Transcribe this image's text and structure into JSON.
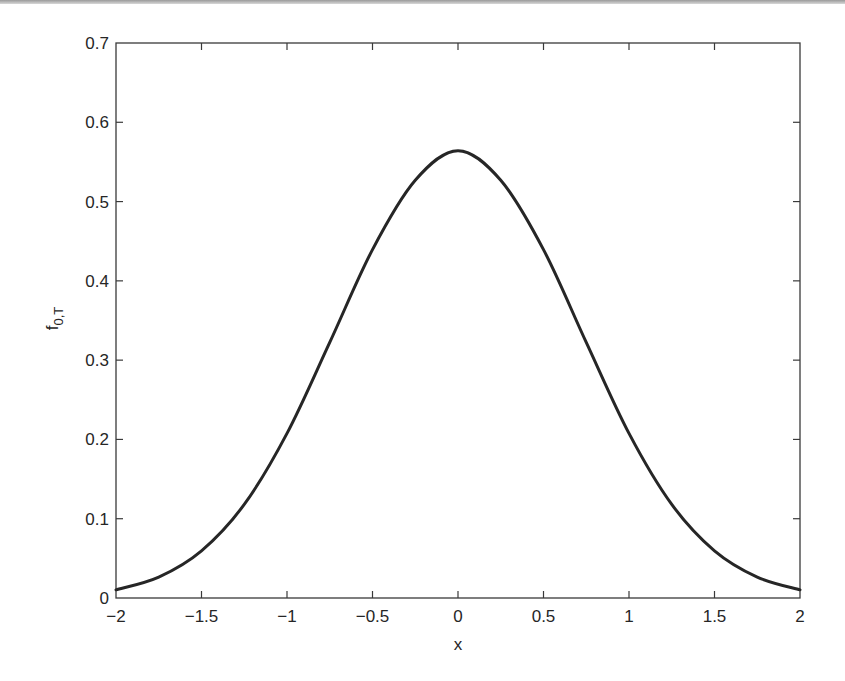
{
  "chart_data": {
    "type": "line",
    "title": "",
    "xlabel": "x",
    "ylabel": "f",
    "ylabel_subscript": "0,T",
    "xlim": [
      -2,
      2
    ],
    "ylim": [
      0,
      0.7
    ],
    "grid": false,
    "legend": null,
    "xticks": [
      -2,
      -1.5,
      -1,
      -0.5,
      0,
      0.5,
      1,
      1.5,
      2
    ],
    "xtick_labels": [
      "−2",
      "−1.5",
      "−1",
      "−0.5",
      "0",
      "0.5",
      "1",
      "1.5",
      "2"
    ],
    "yticks": [
      0,
      0.1,
      0.2,
      0.3,
      0.4,
      0.5,
      0.6,
      0.7
    ],
    "ytick_labels": [
      "0",
      "0.1",
      "0.2",
      "0.3",
      "0.4",
      "0.5",
      "0.6",
      "0.7"
    ],
    "series": [
      {
        "name": "f_0,T",
        "color": "#262626",
        "x": [
          -2.0,
          -1.75,
          -1.5,
          -1.25,
          -1.0,
          -0.75,
          -0.5,
          -0.25,
          0.0,
          0.25,
          0.5,
          0.75,
          1.0,
          1.25,
          1.5,
          1.75,
          2.0
        ],
        "y": [
          0.0103,
          0.0264,
          0.0595,
          0.118,
          0.2076,
          0.3224,
          0.4394,
          0.5268,
          0.5642,
          0.5268,
          0.4394,
          0.3224,
          0.2076,
          0.118,
          0.0595,
          0.0264,
          0.0103
        ]
      }
    ]
  }
}
